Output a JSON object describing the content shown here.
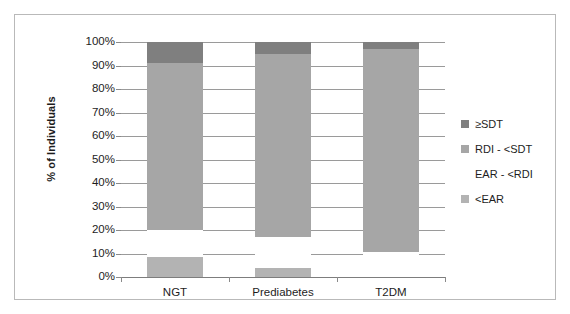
{
  "chart_data": {
    "type": "bar",
    "subtype": "100% stacked column",
    "title": "",
    "subtitle": "",
    "xlabel": "",
    "ylabel": "% of Individuals",
    "categories": [
      "NGT",
      "Prediabetes",
      "T2DM"
    ],
    "series": [
      {
        "name": "<EAR",
        "color": "#b3b3b3",
        "values": [
          8.5,
          4.0,
          0.0
        ]
      },
      {
        "name": "EAR - <RDI",
        "color": "#ffffff",
        "values": [
          11.5,
          13.0,
          10.5
        ]
      },
      {
        "name": "RDI - <SDT",
        "color": "#a6a6a6",
        "values": [
          71.0,
          78.0,
          86.5
        ]
      },
      {
        "name": "≥SDT",
        "color": "#7f7f7f",
        "values": [
          9.0,
          5.0,
          3.0
        ]
      }
    ],
    "stack_order_bottom_to_top": [
      "<EAR",
      "EAR - <RDI",
      "RDI - <SDT",
      "≥SDT"
    ],
    "ylim": [
      0,
      100
    ],
    "ytick_labels": [
      "0%",
      "10%",
      "20%",
      "30%",
      "40%",
      "50%",
      "60%",
      "70%",
      "80%",
      "90%",
      "100%"
    ],
    "ytick_values": [
      0,
      10,
      20,
      30,
      40,
      50,
      60,
      70,
      80,
      90,
      100
    ],
    "grid": true,
    "legend_position": "right",
    "legend": [
      {
        "label": "≥SDT",
        "color": "#7f7f7f"
      },
      {
        "label": "RDI - <SDT",
        "color": "#a6a6a6"
      },
      {
        "label": "EAR - <RDI",
        "color": "#ffffff"
      },
      {
        "label": "<EAR",
        "color": "#b3b3b3"
      }
    ]
  },
  "axis": {
    "y_title": "% of Individuals"
  },
  "colors": {
    "segment_sdt": "#7f7f7f",
    "segment_rdi_sdt": "#a6a6a6",
    "segment_ear_rdi": "#ffffff",
    "segment_ear": "#b3b3b3",
    "gridline": "#9a9a9a",
    "frame": "#b9b9b9",
    "text": "#1d1d1d"
  }
}
